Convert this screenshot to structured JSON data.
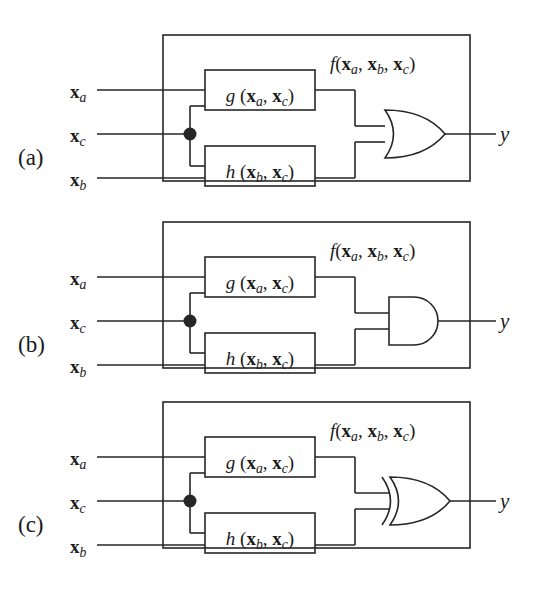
{
  "figure": {
    "name": "logic-function-decomposition",
    "background_color": "#ffffff",
    "line_color": "#262626",
    "panel_count": 3
  },
  "panels": [
    {
      "tag": "(a)",
      "gate": "OR",
      "gate_icon": "or-gate-icon",
      "function_label": "f(x_a, x_b, x_c)",
      "output_label": "y",
      "inputs": [
        "x_a",
        "x_c",
        "x_b"
      ],
      "blocks": [
        {
          "name": "g-block",
          "label": "g (x_a, x_c)"
        },
        {
          "name": "h-block",
          "label": "h (x_b, x_c)"
        }
      ]
    },
    {
      "tag": "(b)",
      "gate": "AND",
      "gate_icon": "and-gate-icon",
      "function_label": "f(x_a, x_b, x_c)",
      "output_label": "y",
      "inputs": [
        "x_a",
        "x_c",
        "x_b"
      ],
      "blocks": [
        {
          "name": "g-block",
          "label": "g (x_a, x_c)"
        },
        {
          "name": "h-block",
          "label": "h (x_b, x_c)"
        }
      ]
    },
    {
      "tag": "(c)",
      "gate": "XOR",
      "gate_icon": "xor-gate-icon",
      "function_label": "f(x_a, x_b, x_c)",
      "output_label": "y",
      "inputs": [
        "x_a",
        "x_c",
        "x_b"
      ],
      "blocks": [
        {
          "name": "g-block",
          "label": "g (x_a, x_c)"
        },
        {
          "name": "h-block",
          "label": "h (x_b, x_c)"
        }
      ]
    }
  ],
  "symbols": {
    "g": "g",
    "h": "h",
    "f": "f",
    "y": "y",
    "x": "x",
    "sub_a": "a",
    "sub_b": "b",
    "sub_c": "c",
    "comma": ",",
    "paren_open": "(",
    "paren_close": ")"
  },
  "junction": {
    "name": "wire-junction-dot",
    "description": "solid dot where x_c fans out to g and h"
  }
}
